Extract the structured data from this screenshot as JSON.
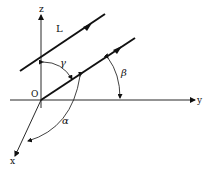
{
  "figure": {
    "axes": {
      "x_label": "x",
      "y_label": "y",
      "z_label": "z",
      "origin_label": "O"
    },
    "line_label": "L",
    "angles": {
      "alpha": "α",
      "beta": "β",
      "gamma": "γ"
    },
    "colors": {
      "ink": "#111111",
      "background": "#ffffff"
    }
  }
}
